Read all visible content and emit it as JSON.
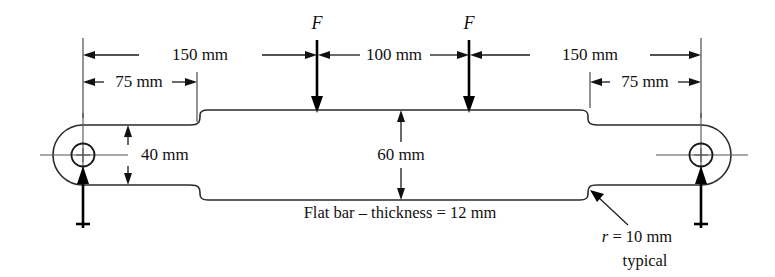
{
  "diagram": {
    "dimensions": {
      "left_span_label": "150 mm",
      "left_quarter_label": "75 mm",
      "center_span_label": "100 mm",
      "right_span_label": "150 mm",
      "right_quarter_label": "75 mm",
      "narrow_height_label": "40 mm",
      "wide_height_label": "60 mm"
    },
    "forces": {
      "left_force_label": "F",
      "right_force_label": "F"
    },
    "notes": {
      "thickness_note": "Flat bar – thickness = 12 mm",
      "radius_note_symbol": "r",
      "radius_note_value": "= 10 mm",
      "radius_note_second_line": "typical"
    },
    "colors": {
      "outline": "#2b2b2b",
      "dimension": "#1a1a1a",
      "centerline": "#555555",
      "force": "#000000",
      "background": "#ffffff"
    }
  }
}
